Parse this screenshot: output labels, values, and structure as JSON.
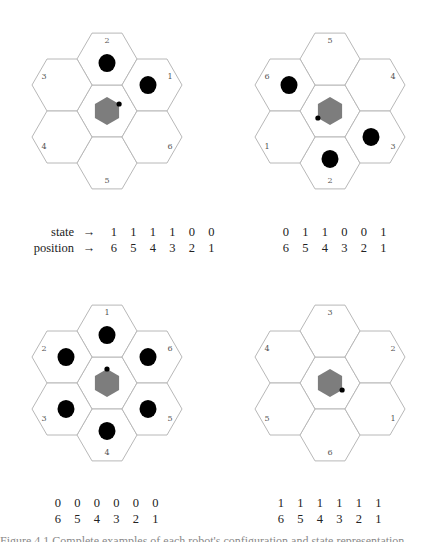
{
  "panels": [
    {
      "id": "top-left",
      "center": [
        107,
        111
      ],
      "labels": {
        "1": "ur",
        "2": "t",
        "3": "ul",
        "4": "ll",
        "5": "b",
        "6": "lr"
      },
      "occupied": [
        "2",
        "1"
      ],
      "marker": "ur",
      "table": {
        "state": [
          "1",
          "1",
          "1",
          "1",
          "0",
          "0"
        ],
        "position": [
          "6",
          "5",
          "4",
          "3",
          "2",
          "1"
        ],
        "show_labels": true
      }
    },
    {
      "id": "top-right",
      "center": [
        330,
        111
      ],
      "labels": {
        "5": "t",
        "4": "ur",
        "3": "lr",
        "2": "b",
        "1": "ll",
        "6": "ul"
      },
      "occupied": [
        "6",
        "3",
        "2"
      ],
      "marker": "ll",
      "table": {
        "state": [
          "0",
          "1",
          "1",
          "0",
          "0",
          "1"
        ],
        "position": [
          "6",
          "5",
          "4",
          "3",
          "2",
          "1"
        ],
        "show_labels": false
      }
    },
    {
      "id": "bottom-left",
      "center": [
        107,
        383
      ],
      "labels": {
        "1": "t",
        "6": "ur",
        "5": "lr",
        "4": "b",
        "3": "ll",
        "2": "ul"
      },
      "occupied": [
        "1",
        "2",
        "3",
        "4",
        "5",
        "6"
      ],
      "marker": "t",
      "table": {
        "state": [
          "0",
          "0",
          "0",
          "0",
          "0",
          "0"
        ],
        "position": [
          "6",
          "5",
          "4",
          "3",
          "2",
          "1"
        ],
        "show_labels": false
      }
    },
    {
      "id": "bottom-right",
      "center": [
        330,
        383
      ],
      "labels": {
        "3": "t",
        "2": "ur",
        "1": "lr",
        "6": "b",
        "5": "ll",
        "4": "ul"
      },
      "occupied": [],
      "marker": "lr",
      "table": {
        "state": [
          "1",
          "1",
          "1",
          "1",
          "1",
          "1"
        ],
        "position": [
          "6",
          "5",
          "4",
          "3",
          "2",
          "1"
        ],
        "show_labels": false
      }
    }
  ],
  "tables": {
    "top_left": {
      "state_label": "state",
      "position_label": "position",
      "arrow": "→",
      "state": [
        "1",
        "1",
        "1",
        "1",
        "0",
        "0"
      ],
      "position": [
        "6",
        "5",
        "4",
        "3",
        "2",
        "1"
      ]
    },
    "top_right": {
      "state": [
        "0",
        "1",
        "1",
        "0",
        "0",
        "1"
      ],
      "position": [
        "6",
        "5",
        "4",
        "3",
        "2",
        "1"
      ]
    },
    "bottom_left": {
      "state": [
        "0",
        "0",
        "0",
        "0",
        "0",
        "0"
      ],
      "position": [
        "6",
        "5",
        "4",
        "3",
        "2",
        "1"
      ]
    },
    "bottom_right": {
      "state": [
        "1",
        "1",
        "1",
        "1",
        "1",
        "1"
      ],
      "position": [
        "6",
        "5",
        "4",
        "3",
        "2",
        "1"
      ]
    }
  },
  "caption": "Figure 4.1 Complete examples of each robot's configuration and state representation",
  "colors": {
    "hex_stroke": "#b8b8b8",
    "robot_fill": "#7d7d7d",
    "module_fill": "#000000"
  }
}
